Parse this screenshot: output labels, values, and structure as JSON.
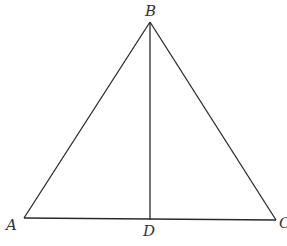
{
  "diagram": {
    "type": "geometry-triangle-with-altitude",
    "stroke_color": "#2a2a2a",
    "label_color": "#333333",
    "background": "#ffffff",
    "points": {
      "A": {
        "x": 24,
        "y": 218
      },
      "B": {
        "x": 150,
        "y": 22
      },
      "C": {
        "x": 276,
        "y": 220
      },
      "D": {
        "x": 150,
        "y": 220
      }
    },
    "segments": [
      {
        "from": "A",
        "to": "B"
      },
      {
        "from": "B",
        "to": "C"
      },
      {
        "from": "A",
        "to": "C"
      },
      {
        "from": "B",
        "to": "D"
      }
    ],
    "labels": {
      "A": "A",
      "B": "B",
      "C": "C",
      "D": "D"
    }
  }
}
